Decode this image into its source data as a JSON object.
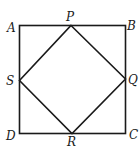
{
  "diagram": {
    "outer_square": {
      "vertices": [
        "A",
        "B",
        "C",
        "D"
      ]
    },
    "inner_square": {
      "vertices": [
        "P",
        "Q",
        "R",
        "S"
      ]
    },
    "labels": {
      "A": "A",
      "B": "B",
      "C": "C",
      "D": "D",
      "P": "P",
      "Q": "Q",
      "R": "R",
      "S": "S"
    },
    "stroke_color": "#1a1a1a",
    "background_color": "#ffffff"
  }
}
